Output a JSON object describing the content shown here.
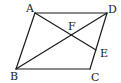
{
  "diagram": {
    "type": "parallelogram-geometry",
    "points": {
      "A": {
        "label": "A",
        "x": 35,
        "y": 13,
        "lx": 26,
        "ly": 12
      },
      "D": {
        "label": "D",
        "x": 107,
        "y": 13,
        "lx": 108,
        "ly": 13
      },
      "B": {
        "label": "B",
        "x": 16,
        "y": 69,
        "lx": 10,
        "ly": 80
      },
      "C": {
        "label": "C",
        "x": 90,
        "y": 69,
        "lx": 91,
        "ly": 81
      },
      "E": {
        "label": "E",
        "x": 96,
        "y": 50,
        "lx": 100,
        "ly": 57
      },
      "F": {
        "label": "F",
        "x": 71,
        "y": 35,
        "lx": 68,
        "ly": 30
      }
    },
    "segments": [
      {
        "from": "A",
        "to": "D"
      },
      {
        "from": "D",
        "to": "C"
      },
      {
        "from": "C",
        "to": "B"
      },
      {
        "from": "B",
        "to": "A"
      },
      {
        "from": "B",
        "to": "D"
      },
      {
        "from": "A",
        "to": "E"
      }
    ],
    "stroke_color": "#1a1a1a",
    "background": "#ffffff"
  }
}
